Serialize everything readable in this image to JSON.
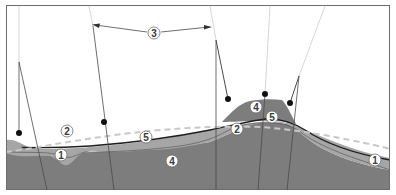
{
  "diagram": {
    "type": "geological cross-section with drill lines",
    "colors": {
      "background": "#ffffff",
      "frame": "#6e6e6e",
      "layer_deep": "#7d7d7d",
      "layer_upper": "#a6a6a6",
      "surface_line": "#1e1e1e",
      "dashed_line": "#c8c8c8",
      "drill_line": "#4a4a4a",
      "drill_line_faint": "#c4c4c4",
      "marker": "#111111"
    },
    "labels": [
      {
        "id": "label-1-left",
        "text": "1",
        "x": 61,
        "y": 155
      },
      {
        "id": "label-2-left",
        "text": "2",
        "x": 67,
        "y": 131
      },
      {
        "id": "label-3",
        "text": "3",
        "x": 154,
        "y": 33
      },
      {
        "id": "label-4-bottom",
        "text": "4",
        "x": 172,
        "y": 161
      },
      {
        "id": "label-5-left",
        "text": "5",
        "x": 146,
        "y": 137
      },
      {
        "id": "label-4-bump",
        "text": "4",
        "x": 256,
        "y": 107
      },
      {
        "id": "label-5-right",
        "text": "5",
        "x": 272,
        "y": 117
      },
      {
        "id": "label-2-right",
        "text": "2",
        "x": 237,
        "y": 129
      },
      {
        "id": "label-1-right",
        "text": "1",
        "x": 375,
        "y": 160
      }
    ],
    "dimension_arrow": {
      "label": "3",
      "from_x": 92,
      "from_y": 25,
      "to_x": 211,
      "to_y": 27
    }
  }
}
